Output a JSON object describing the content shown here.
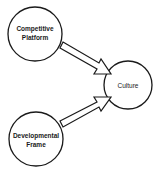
{
  "diagram": {
    "type": "concept-map",
    "nodes": [
      {
        "id": "competitive-platform",
        "line1": "Competitive",
        "line2": "Platform",
        "cx": 35,
        "cy": 34,
        "r": 27
      },
      {
        "id": "culture",
        "line1": "Culture",
        "cx": 128,
        "cy": 85,
        "r": 24
      },
      {
        "id": "developmental-frame",
        "line1": "Developmental",
        "line2": "Frame",
        "cx": 36,
        "cy": 139,
        "r": 27
      }
    ],
    "edges": [
      {
        "from": "competitive-platform",
        "to": "culture",
        "style": "block-arrow"
      },
      {
        "from": "developmental-frame",
        "to": "culture",
        "style": "block-arrow"
      }
    ],
    "colors": {
      "stroke": "#1a1a1a",
      "fill": "#ffffff",
      "background": "#ffffff"
    }
  }
}
